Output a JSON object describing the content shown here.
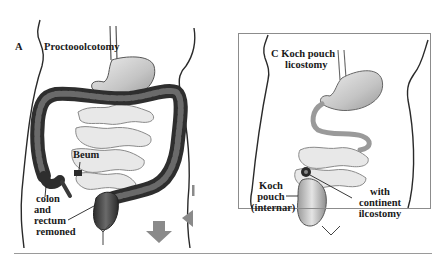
{
  "figure": {
    "panels": [
      {
        "id": "A",
        "letter": "A",
        "title": "Proctooolcotomy",
        "annotations": {
          "ileum": "Beum",
          "removed_line1": "colon",
          "removed_line2": "and",
          "removed_line3": "rectum",
          "removed_line4": "remoned"
        }
      },
      {
        "id": "C",
        "letter": "C",
        "title_line1": "Koch pouch",
        "title_line2": "licostomy",
        "annotations": {
          "pouch_line1": "Koch",
          "pouch_line2": "pouch",
          "pouch_line3": "(internar)",
          "stoma_line1": "with",
          "stoma_line2": "continent",
          "stoma_line3": "ilcostomy"
        }
      }
    ],
    "colors": {
      "outline": "#2a2a2a",
      "colon_dark": "#3c3c3c",
      "stomach_fill": "#c8c8c8",
      "intestine_fill": "#e6e6e6",
      "arrow_gray": "#8a8a8a",
      "frame_gray": "#8c8c8c"
    }
  }
}
